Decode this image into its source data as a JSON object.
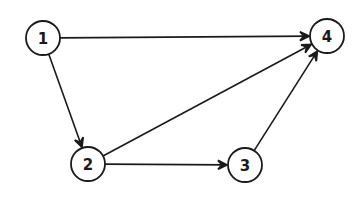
{
  "diagram": {
    "type": "directed-graph",
    "colors": {
      "ink": "#1a1a1a",
      "background": "#ffffff"
    },
    "node_radius": 17,
    "nodes": [
      {
        "id": "1",
        "label": "1",
        "x": 43,
        "y": 38
      },
      {
        "id": "2",
        "label": "2",
        "x": 88,
        "y": 164
      },
      {
        "id": "3",
        "label": "3",
        "x": 245,
        "y": 165
      },
      {
        "id": "4",
        "label": "4",
        "x": 327,
        "y": 36
      }
    ],
    "edges": [
      {
        "from": "1",
        "to": "4"
      },
      {
        "from": "1",
        "to": "2"
      },
      {
        "from": "2",
        "to": "4"
      },
      {
        "from": "2",
        "to": "3"
      },
      {
        "from": "3",
        "to": "4"
      }
    ]
  }
}
